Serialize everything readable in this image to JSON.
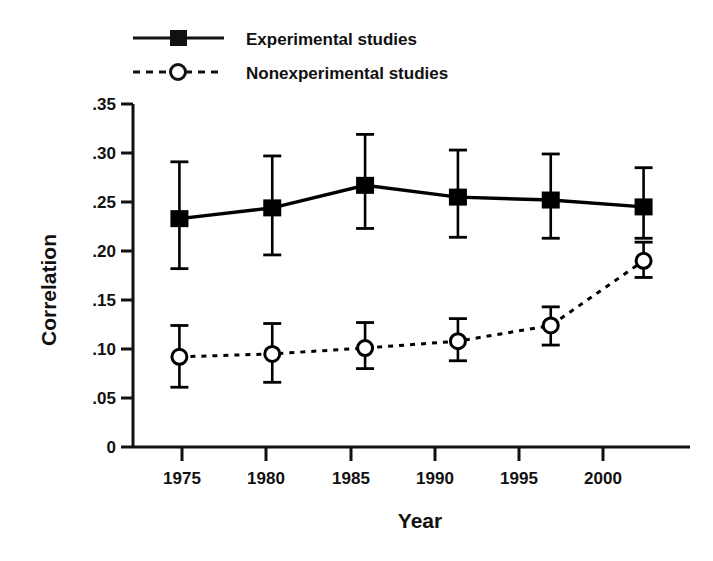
{
  "chart_data": {
    "type": "line",
    "title": "",
    "xlabel": "Year",
    "ylabel": "Correlation",
    "categories": [
      "1975",
      "1980",
      "1985",
      "1990",
      "1995",
      "2000"
    ],
    "x": [
      1975,
      1980,
      1985,
      1990,
      1995,
      2000
    ],
    "xlim": [
      1972.5,
      2002.5
    ],
    "ylim": [
      0,
      0.35
    ],
    "grid": false,
    "legend_position": "top-center",
    "y_ticks": [
      0,
      0.05,
      0.1,
      0.15,
      0.2,
      0.25,
      0.3,
      0.35
    ],
    "y_tick_labels": [
      "0",
      ".05",
      ".10",
      ".15",
      ".20",
      ".25",
      ".30",
      ".35"
    ],
    "x_tick_labels": [
      "1975",
      "1980",
      "1985",
      "1990",
      "1995",
      "2000"
    ],
    "series": [
      {
        "name": "Experimental studies",
        "marker": "filled-square",
        "linestyle": "solid",
        "color": "#000000",
        "values": [
          0.233,
          0.244,
          0.267,
          0.255,
          0.252,
          0.245
        ],
        "err_low": [
          0.182,
          0.196,
          0.223,
          0.214,
          0.213,
          0.213
        ],
        "err_high": [
          0.291,
          0.297,
          0.319,
          0.303,
          0.299,
          0.285
        ]
      },
      {
        "name": "Nonexperimental studies",
        "marker": "open-circle",
        "linestyle": "dashed",
        "color": "#000000",
        "values": [
          0.092,
          0.095,
          0.101,
          0.108,
          0.124,
          0.19
        ],
        "err_low": [
          0.061,
          0.066,
          0.08,
          0.088,
          0.104,
          0.173
        ],
        "err_high": [
          0.124,
          0.126,
          0.127,
          0.131,
          0.143,
          0.209
        ]
      }
    ]
  },
  "legend": {
    "items": [
      {
        "label": "Experimental studies",
        "marker": "filled-square",
        "linestyle": "solid"
      },
      {
        "label": "Nonexperimental studies",
        "marker": "open-circle",
        "linestyle": "dashed"
      }
    ]
  },
  "axes": {
    "y_title": "Correlation",
    "x_title": "Year"
  }
}
